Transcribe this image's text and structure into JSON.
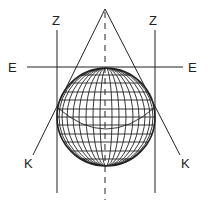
{
  "diagram": {
    "labels": {
      "z_left": "Z",
      "z_right": "Z",
      "e_left": "E",
      "e_right": "E",
      "k_left": "K",
      "k_right": "K"
    },
    "colors": {
      "line": "#222222",
      "background": "#ffffff"
    }
  }
}
